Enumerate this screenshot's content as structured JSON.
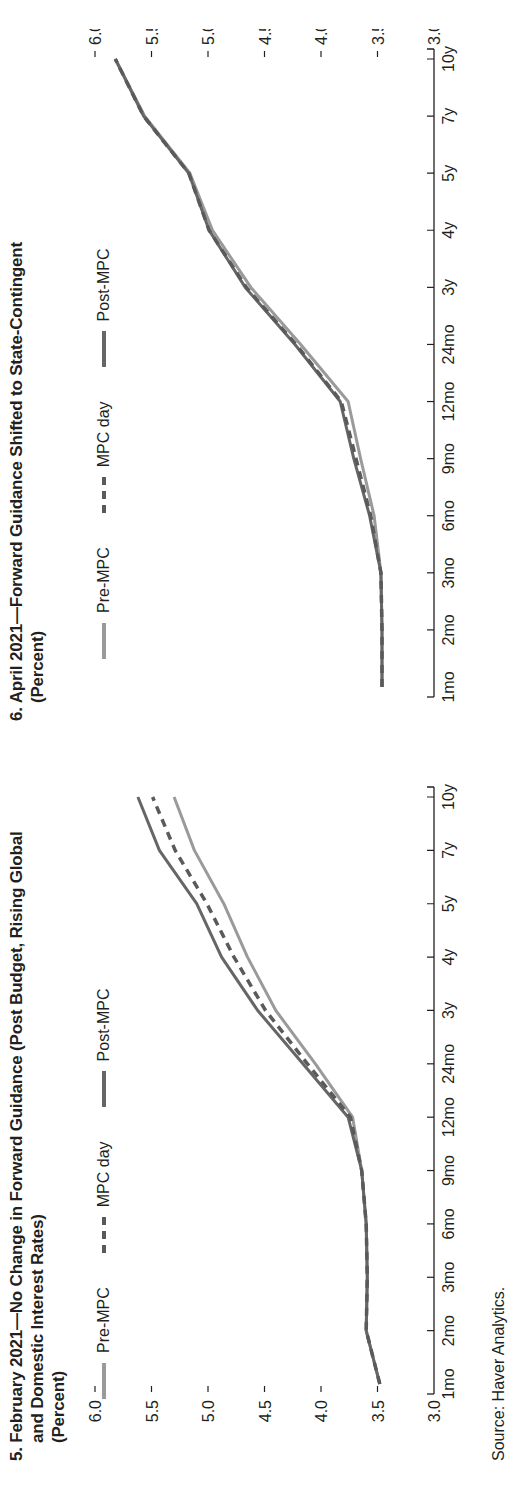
{
  "source": "Source: Haver Analytics.",
  "legend_labels": {
    "pre": "Pre-MPC",
    "day": "MPC day",
    "post": "Post-MPC"
  },
  "colors": {
    "pre": "#9a9a9a",
    "day": "#5a5a5a",
    "post": "#666666",
    "axis": "#231f20"
  },
  "chart_data": [
    {
      "type": "line",
      "title": "5. February 2021—No Change in Forward Guidance (Post Budget, Rising Global",
      "title_line2": "and Domestic Interest Rates)",
      "units": "(Percent)",
      "categories": [
        "1mo",
        "2mo",
        "3mo",
        "6mo",
        "9mo",
        "12mo",
        "24mo",
        "3y",
        "4y",
        "5y",
        "7y",
        "10y"
      ],
      "yticks": [
        "3.0",
        "3.5",
        "4.0",
        "4.5",
        "5.0",
        "5.5",
        "6.0"
      ],
      "ylim": [
        3.0,
        6.0
      ],
      "ylabel_side": "left",
      "xlabel": "",
      "ylabel": "",
      "grid": false,
      "legend_position": "top-left",
      "series": [
        {
          "name": "Pre-MPC",
          "style": "solid-light",
          "values": [
            3.48,
            3.6,
            3.59,
            3.6,
            3.64,
            3.72,
            4.05,
            4.4,
            4.65,
            4.86,
            5.12,
            5.3
          ]
        },
        {
          "name": "MPC day",
          "style": "dashed",
          "values": [
            3.48,
            3.6,
            3.59,
            3.6,
            3.64,
            3.74,
            4.12,
            4.49,
            4.77,
            5.01,
            5.29,
            5.49
          ]
        },
        {
          "name": "Post-MPC",
          "style": "solid-dark",
          "values": [
            3.48,
            3.6,
            3.59,
            3.6,
            3.64,
            3.76,
            4.16,
            4.56,
            4.88,
            5.1,
            5.43,
            5.62
          ]
        }
      ]
    },
    {
      "type": "line",
      "title": "6. April 2021—Forward Guidance Shifted to State-Contingent",
      "title_line2": "",
      "units": "(Percent)",
      "categories": [
        "1mo",
        "2mo",
        "3mo",
        "6mo",
        "9mo",
        "12mo",
        "24mo",
        "3y",
        "4y",
        "5y",
        "7y",
        "10y"
      ],
      "yticks": [
        "3.0",
        "3.5",
        "4.0",
        "4.5",
        "5.0",
        "5.5",
        "6.0"
      ],
      "ylim": [
        3.0,
        6.0
      ],
      "ylabel_side": "right",
      "xlabel": "",
      "ylabel": "",
      "grid": false,
      "legend_position": "top-left",
      "series": [
        {
          "name": "Pre-MPC",
          "style": "solid-light",
          "values": [
            3.46,
            3.46,
            3.47,
            3.53,
            3.65,
            3.76,
            4.18,
            4.62,
            4.96,
            5.16,
            5.56,
            5.82
          ]
        },
        {
          "name": "MPC day",
          "style": "dashed",
          "values": [
            3.46,
            3.46,
            3.47,
            3.56,
            3.69,
            3.82,
            4.22,
            4.66,
            4.99,
            5.17,
            5.57,
            5.82
          ]
        },
        {
          "name": "Post-MPC",
          "style": "solid-dark",
          "values": [
            3.46,
            3.46,
            3.47,
            3.57,
            3.71,
            3.83,
            4.23,
            4.67,
            4.99,
            5.17,
            5.57,
            5.82
          ]
        }
      ]
    }
  ]
}
